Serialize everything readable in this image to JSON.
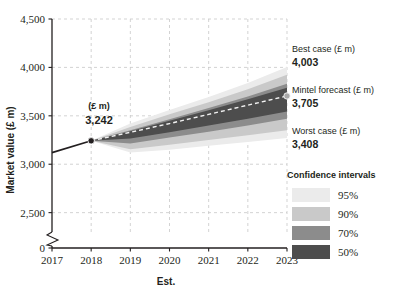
{
  "chart_data": {
    "type": "area",
    "title": "",
    "xlabel": "Est.",
    "ylabel": "Market value (£ m)",
    "x": [
      2017,
      2018,
      2019,
      2020,
      2021,
      2022,
      2023
    ],
    "tick_labels_x": [
      "2017",
      "2018",
      "2019",
      "2020",
      "2021",
      "2022",
      "2023"
    ],
    "tick_labels_y": [
      "0",
      "2,500",
      "3,000",
      "3,500",
      "4,000",
      "4,500"
    ],
    "ylim": [
      2300,
      4500
    ],
    "y_axis_break": true,
    "grid": true,
    "legend_position": "right",
    "historical": {
      "name": "Historical",
      "x": [
        2017,
        2018
      ],
      "values": [
        3120,
        3242
      ],
      "color": "#231f20"
    },
    "central_forecast": {
      "name": "Mintel forecast",
      "x": [
        2018,
        2019,
        2020,
        2021,
        2022,
        2023
      ],
      "values": [
        3242,
        3330,
        3420,
        3515,
        3610,
        3705
      ],
      "style": "dashed",
      "color": "#f2f2f2"
    },
    "bands": [
      {
        "name": "95%",
        "level": 95,
        "color": "#ebebeb",
        "upper": [
          3242,
          3420,
          3560,
          3695,
          3840,
          4003
        ],
        "lower": [
          3242,
          3120,
          3150,
          3190,
          3230,
          3270
        ]
      },
      {
        "name": "90%",
        "level": 90,
        "color": "#c9c9c9",
        "upper": [
          3242,
          3385,
          3515,
          3640,
          3775,
          3925
        ],
        "lower": [
          3242,
          3155,
          3200,
          3250,
          3300,
          3350
        ]
      },
      {
        "name": "70%",
        "level": 70,
        "color": "#8c8c8c",
        "upper": [
          3242,
          3350,
          3465,
          3580,
          3700,
          3830
        ],
        "lower": [
          3242,
          3215,
          3275,
          3335,
          3400,
          3470
        ]
      },
      {
        "name": "50%",
        "level": 50,
        "color": "#4d4d4d",
        "upper": [
          3242,
          3340,
          3450,
          3558,
          3670,
          3790
        ],
        "lower": [
          3242,
          3265,
          3330,
          3400,
          3470,
          3545
        ]
      }
    ],
    "markers": [
      {
        "label_top": "(£ m)",
        "label_value": "3,242",
        "x": 2018,
        "y": 3242,
        "color": "#231f20"
      },
      {
        "label_top": "",
        "label_value": "",
        "x": 2023,
        "y": 3705,
        "color": "#a8a8a8"
      }
    ],
    "annotations": [
      {
        "title": "Best case (£ m)",
        "value": "4,003"
      },
      {
        "title": "Mintel forecast (£ m)",
        "value": "3,705"
      },
      {
        "title": "Worst case (£ m)",
        "value": "3,408"
      }
    ],
    "legend": {
      "title": "Confidence intervals",
      "items": [
        {
          "label": "95%",
          "color": "#ebebeb"
        },
        {
          "label": "90%",
          "color": "#c9c9c9"
        },
        {
          "label": "70%",
          "color": "#8c8c8c"
        },
        {
          "label": "50%",
          "color": "#4d4d4d"
        }
      ]
    },
    "colors": {
      "grid": "#c8c8c8",
      "axis": "#231f20",
      "background": "#ffffff"
    }
  }
}
